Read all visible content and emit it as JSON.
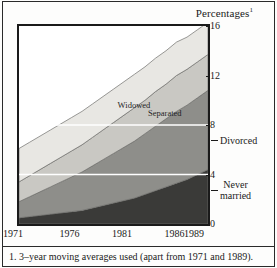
{
  "figure": {
    "axis_title": "Percentages",
    "axis_title_superscript": "1",
    "footnote": "1. 3–year moving averages used (apart from 1971 and 1989)."
  },
  "colors": {
    "widowed": "#e8e7e3",
    "separated": "#c9c8c3",
    "divorced": "#8e8e8a",
    "never_married": "#3a3a38",
    "frame": "#1a1a1a",
    "gridline": "#ffffff",
    "band_edge": "#6f6f6c"
  },
  "callouts": [
    {
      "label": "Divorced",
      "value": 6.6
    },
    {
      "label": "Never",
      "label2": "married",
      "value": 2.6
    }
  ],
  "inplot_labels": [
    {
      "text": "Widowed",
      "x_year": 1980.2,
      "y_value": 9.5
    },
    {
      "text": "Separated",
      "x_year": 1983.1,
      "y_value": 8.9
    }
  ],
  "chart_data": {
    "type": "area",
    "title": "Percentages",
    "xlabel": "",
    "ylabel": "Percentages",
    "xlim": [
      1971,
      1989
    ],
    "ylim": [
      0,
      16
    ],
    "yticks": [
      0,
      4,
      8,
      12,
      16
    ],
    "ytick_labels": [
      "0",
      "4",
      "8",
      "12",
      "16"
    ],
    "xticks": [
      1971,
      1976,
      1981,
      1986,
      1989
    ],
    "xtick_labels": [
      "1971",
      "1976",
      "1981",
      "1986",
      "1989"
    ],
    "grid": true,
    "gridlines_y": [
      4,
      8
    ],
    "stacked": true,
    "legend_position": "inline-annotations",
    "x": [
      1971,
      1972,
      1973,
      1974,
      1975,
      1976,
      1977,
      1978,
      1979,
      1980,
      1981,
      1982,
      1983,
      1984,
      1985,
      1986,
      1987,
      1988,
      1989
    ],
    "series": [
      {
        "name": "Never married",
        "color": "#3a3a38",
        "values": [
          0.5,
          0.6,
          0.7,
          0.8,
          0.9,
          1.0,
          1.1,
          1.3,
          1.5,
          1.7,
          1.9,
          2.1,
          2.4,
          2.7,
          3.0,
          3.3,
          3.6,
          4.0,
          4.4
        ]
      },
      {
        "name": "Divorced",
        "color": "#8e8e8a",
        "values": [
          1.3,
          1.6,
          1.9,
          2.2,
          2.5,
          2.8,
          3.1,
          3.4,
          3.7,
          4.0,
          4.3,
          4.6,
          4.9,
          5.2,
          5.5,
          5.8,
          6.0,
          6.2,
          6.4
        ]
      },
      {
        "name": "Separated",
        "color": "#c9c8c3",
        "values": [
          1.6,
          1.7,
          1.8,
          1.9,
          2.0,
          2.1,
          2.2,
          2.3,
          2.4,
          2.5,
          2.6,
          2.7,
          2.7,
          2.8,
          2.8,
          2.9,
          2.9,
          2.9,
          2.9
        ]
      },
      {
        "name": "Widowed",
        "color": "#e8e7e3",
        "values": [
          2.7,
          2.7,
          2.7,
          2.7,
          2.7,
          2.7,
          2.7,
          2.7,
          2.7,
          2.7,
          2.7,
          2.7,
          2.7,
          2.7,
          2.7,
          2.7,
          2.6,
          2.6,
          2.6
        ]
      }
    ],
    "cumulative_top": [
      6.1,
      6.6,
      7.1,
      7.6,
      8.1,
      8.6,
      9.1,
      9.7,
      10.3,
      10.9,
      11.5,
      12.1,
      12.7,
      13.4,
      14.0,
      14.7,
      15.1,
      15.7,
      16.3
    ]
  }
}
